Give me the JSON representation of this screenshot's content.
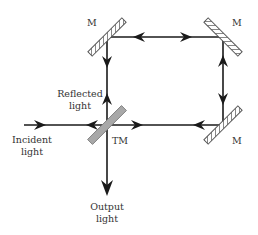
{
  "diagram": {
    "type": "sagnac-interferometer-optical-path",
    "labels": {
      "mirror_top_left": "M",
      "mirror_top_right": "M",
      "mirror_bottom_right": "M",
      "beam_splitter": "TM",
      "reflected_line1": "Reflected",
      "reflected_line2": "light",
      "incident_line1": "Incident",
      "incident_line2": "light",
      "output_line1": "Output",
      "output_line2": "light"
    },
    "nodes": [
      {
        "id": "M1",
        "label": "M",
        "x": 107,
        "y": 37
      },
      {
        "id": "M2",
        "label": "M",
        "x": 223,
        "y": 37
      },
      {
        "id": "M3",
        "label": "M",
        "x": 223,
        "y": 125
      },
      {
        "id": "TM",
        "label": "TM",
        "x": 107,
        "y": 125
      }
    ],
    "colors": {
      "beam": "#1a1a1a",
      "mirror_hatch": "#555555",
      "beam_splitter_fill": "#a8a8a8",
      "text": "#333333"
    }
  }
}
